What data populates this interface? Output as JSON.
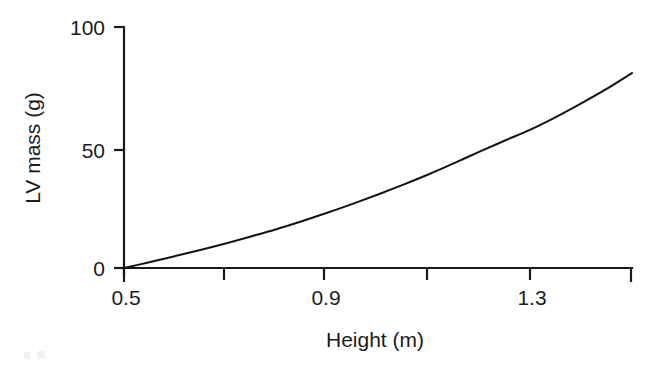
{
  "figure": {
    "background_color": "#ffffff",
    "line_color": "#141414",
    "axis_color": "#1a1a1a"
  },
  "chart_data": {
    "type": "line",
    "title": "",
    "subtitle": "",
    "xlabel": "Height (m)",
    "ylabel": "LV mass (g)",
    "xlim": [
      0.5,
      1.5
    ],
    "ylim": [
      0,
      100
    ],
    "grid": false,
    "legend": false,
    "legend_position": "none",
    "x_ticks": [
      0.5,
      0.7,
      0.9,
      1.1,
      1.3,
      1.5
    ],
    "x_tick_labels": [
      "0.5",
      "",
      "0.9",
      "",
      "1.3",
      ""
    ],
    "x_labeled_ticks": [
      "0.5",
      "0.9",
      "1.3"
    ],
    "y_ticks": [
      0,
      50,
      100
    ],
    "y_tick_labels": [
      "0",
      "50",
      "100"
    ],
    "annotations": [],
    "series": [
      {
        "name": "LV mass vs height",
        "x": [
          0.5,
          0.55,
          0.6,
          0.65,
          0.7,
          0.75,
          0.8,
          0.85,
          0.9,
          0.95,
          1.0,
          1.05,
          1.1,
          1.15,
          1.2,
          1.25,
          1.3,
          1.35,
          1.4,
          1.45,
          1.5
        ],
        "values": [
          0.0,
          2.4,
          4.9,
          7.5,
          10.2,
          13.1,
          16.1,
          19.4,
          22.9,
          26.6,
          30.5,
          34.6,
          38.9,
          43.5,
          48.3,
          52.9,
          57.4,
          62.6,
          68.3,
          74.3,
          80.9
        ]
      }
    ]
  },
  "labels": {
    "y_axis_title": "LV mass (g)",
    "x_axis_title": "Height (m)",
    "y_100": "100",
    "y_50": "50",
    "y_0": "0",
    "x_05": "0.5",
    "x_09": "0.9",
    "x_13": "1.3"
  }
}
